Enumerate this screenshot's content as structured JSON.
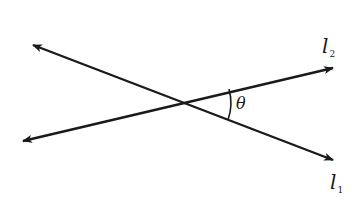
{
  "diagram": {
    "type": "intersecting-lines",
    "stroke_color": "#1a1a1a",
    "background": "#ffffff",
    "lines": [
      {
        "name": "l",
        "subscript": "1",
        "start": [
          33,
          45
        ],
        "end": [
          333,
          160
        ],
        "arrows": "both"
      },
      {
        "name": "l",
        "subscript": "2",
        "start": [
          23,
          141
        ],
        "end": [
          333,
          68
        ],
        "arrows": "both"
      }
    ],
    "intersection": [
      178,
      101
    ],
    "angle": {
      "label": "θ",
      "between": [
        "l1",
        "l2"
      ],
      "side": "right"
    }
  }
}
